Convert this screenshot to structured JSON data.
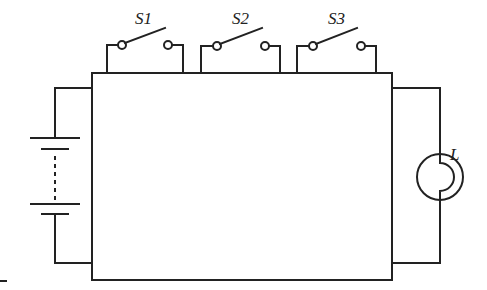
{
  "diagram": {
    "type": "circuit",
    "labels": {
      "switch1": "S1",
      "switch2": "S2",
      "switch3": "S3",
      "lamp": "L"
    },
    "components": [
      {
        "id": "S1",
        "kind": "switch",
        "state": "open"
      },
      {
        "id": "S2",
        "kind": "switch",
        "state": "open"
      },
      {
        "id": "S3",
        "kind": "switch",
        "state": "open"
      },
      {
        "id": "battery",
        "kind": "multi-cell battery"
      },
      {
        "id": "L",
        "kind": "lamp"
      },
      {
        "id": "box",
        "kind": "black box"
      }
    ],
    "colors": {
      "stroke": "#222222",
      "background": "#ffffff"
    }
  }
}
